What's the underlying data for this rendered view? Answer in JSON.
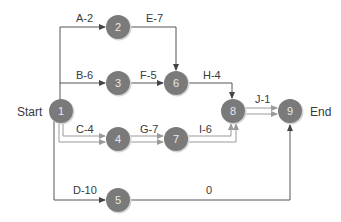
{
  "diagram": {
    "type": "activity-on-arrow network",
    "start_label": "Start",
    "end_label": "End",
    "colors": {
      "node_fill": "#7a7a7a",
      "node_shadow": "#d4d4d4",
      "line": "#555555",
      "critical_line": "#9a9a9a",
      "text": "#3a3a3a",
      "node_text": "#e9e9e9"
    },
    "nodes": [
      {
        "id": "1",
        "label": "1"
      },
      {
        "id": "2",
        "label": "2"
      },
      {
        "id": "3",
        "label": "3"
      },
      {
        "id": "4",
        "label": "4"
      },
      {
        "id": "5",
        "label": "5"
      },
      {
        "id": "6",
        "label": "6"
      },
      {
        "id": "7",
        "label": "7"
      },
      {
        "id": "8",
        "label": "8"
      },
      {
        "id": "9",
        "label": "9"
      }
    ],
    "activities": [
      {
        "from": "1",
        "to": "2",
        "label": "A-2",
        "critical": false
      },
      {
        "from": "1",
        "to": "3",
        "label": "B-6",
        "critical": false
      },
      {
        "from": "1",
        "to": "4",
        "label": "C-4",
        "critical": true
      },
      {
        "from": "1",
        "to": "5",
        "label": "D-10",
        "critical": false
      },
      {
        "from": "2",
        "to": "6",
        "label": "E-7",
        "critical": false
      },
      {
        "from": "3",
        "to": "6",
        "label": "F-5",
        "critical": false
      },
      {
        "from": "4",
        "to": "7",
        "label": "G-7",
        "critical": true
      },
      {
        "from": "6",
        "to": "8",
        "label": "H-4",
        "critical": false
      },
      {
        "from": "7",
        "to": "8",
        "label": "I-6",
        "critical": true
      },
      {
        "from": "8",
        "to": "9",
        "label": "J-1",
        "critical": true
      },
      {
        "from": "5",
        "to": "9",
        "label": "0",
        "critical": false
      }
    ]
  }
}
